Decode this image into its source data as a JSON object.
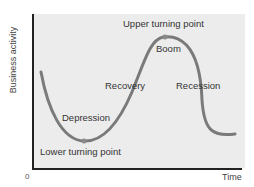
{
  "diagram": {
    "y_axis_label": "Business activity",
    "x_axis_label": "Time",
    "origin_label": "0",
    "phases": {
      "upper_turning_point": "Upper turning point",
      "boom": "Boom",
      "recovery": "Recovery",
      "recession": "Recession",
      "depression": "Depression",
      "lower_turning_point": "Lower turning point"
    },
    "colors": {
      "background": "#ececec",
      "curve": "#7a7a7a",
      "axis": "#222222",
      "text": "#333333"
    }
  }
}
